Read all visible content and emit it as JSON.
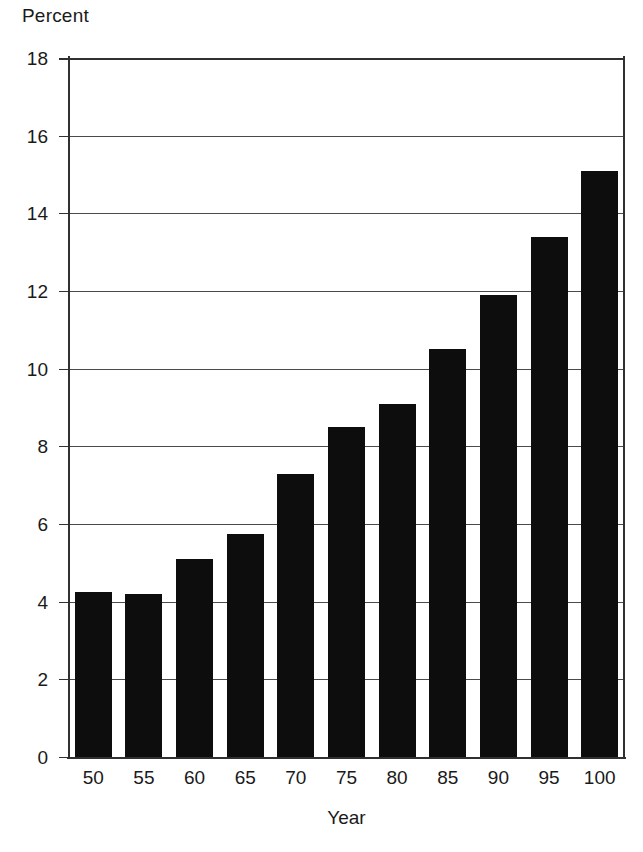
{
  "chart_data": {
    "type": "bar",
    "title": "",
    "xlabel": "Year",
    "ylabel": "Percent",
    "categories": [
      "50",
      "55",
      "60",
      "65",
      "70",
      "75",
      "80",
      "85",
      "90",
      "95",
      "100"
    ],
    "values": [
      4.25,
      4.2,
      5.1,
      5.75,
      7.3,
      8.5,
      9.1,
      10.5,
      11.9,
      13.4,
      15.1
    ],
    "ylim": [
      0,
      18
    ],
    "ytick_labels": [
      "18",
      "16",
      "14",
      "12",
      "10",
      "8",
      "6",
      "4",
      "2",
      "0"
    ],
    "ytick_values": [
      18,
      16,
      14,
      12,
      10,
      8,
      6,
      4,
      2,
      0
    ],
    "xtick_labels": [
      "50",
      "55",
      "60",
      "65",
      "70",
      "75",
      "80",
      "85",
      "90",
      "95",
      "100"
    ],
    "grid": true,
    "legend": "none",
    "bar_color": "#0d0d0d",
    "axis_color": "#303030",
    "grid_color": "#4a4a4a",
    "background_color": "#ffffff"
  }
}
